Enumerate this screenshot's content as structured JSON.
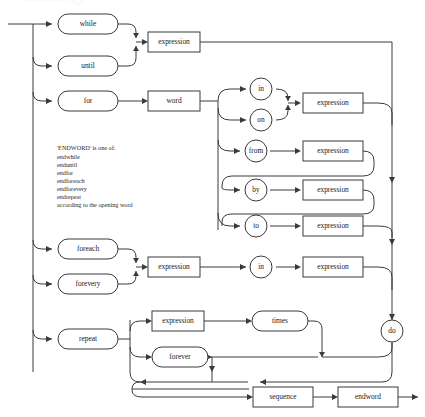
{
  "diagram": {
    "type": "railroad-syntax-diagram",
    "line_color": "#3a3a3a",
    "background": "#ffffff",
    "note": {
      "heading": "'ENDWORD' is one of:",
      "items": [
        "endwhile",
        "enduntil",
        "endfor",
        "endforeach",
        "endforevery",
        "endrepeat"
      ],
      "footer": "according to the opening word"
    },
    "nodes": {
      "while": "while",
      "until": "until",
      "for": "for",
      "word": "word",
      "expr_cond": "expression",
      "in1": "in",
      "on1": "on",
      "expr_in_on": "expression",
      "from": "from",
      "expr_from": "expression",
      "by": "by",
      "expr_by": "expression",
      "to": "to",
      "expr_to": "expression",
      "foreach": "foreach",
      "forevery": "forevery",
      "expr_foreach": "expression",
      "in2": "in",
      "expr_in2": "expression",
      "repeat": "repeat",
      "expr_repeat": "expression",
      "times": "times",
      "forever": "forever",
      "do": "do",
      "sequence": "sequence",
      "endword": "endword"
    },
    "node_shapes": {
      "rounded": [
        "while",
        "until",
        "for",
        "foreach",
        "forevery",
        "repeat",
        "times",
        "forever"
      ],
      "rectangle": [
        "word",
        "expr_cond",
        "expr_in_on",
        "expr_from",
        "expr_by",
        "expr_to",
        "expr_foreach",
        "expr_in2",
        "expr_repeat",
        "sequence",
        "endword"
      ],
      "circle": [
        "in1",
        "on1",
        "from",
        "by",
        "to",
        "in2",
        "do"
      ]
    },
    "branches": [
      "while | until  →  expression",
      "for → word → ( in | on ) → expression",
      "for → word → from → expression → [ by → expression ] → to → expression",
      "foreach | forevery → expression → in → expression",
      "repeat → expression → times",
      "repeat → forever",
      "→ do → sequence → endword"
    ]
  }
}
